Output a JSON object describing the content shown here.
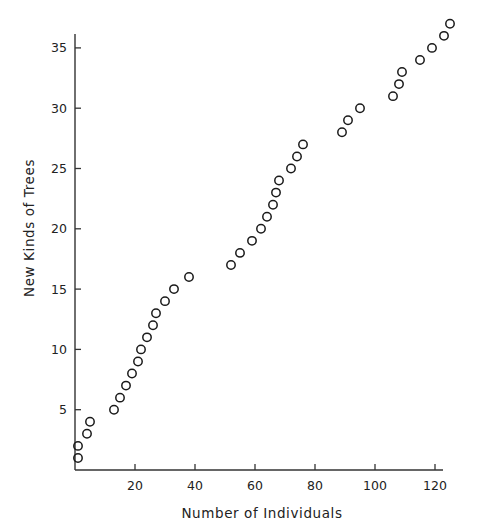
{
  "chart_data": {
    "type": "scatter",
    "title": "",
    "xlabel": "Number of Individuals",
    "ylabel": "New Kinds of Trees",
    "xlim": [
      0,
      125
    ],
    "ylim": [
      0,
      37
    ],
    "x_ticks": [
      20,
      40,
      60,
      80,
      100,
      120
    ],
    "y_ticks": [
      5,
      10,
      15,
      20,
      25,
      30,
      35
    ],
    "grid": false,
    "legend": null,
    "marker": "open-circle",
    "series": [
      {
        "name": "New kinds of trees",
        "points": [
          [
            1,
            1
          ],
          [
            1,
            2
          ],
          [
            4,
            3
          ],
          [
            5,
            4
          ],
          [
            13,
            5
          ],
          [
            15,
            6
          ],
          [
            17,
            7
          ],
          [
            19,
            8
          ],
          [
            21,
            9
          ],
          [
            22,
            10
          ],
          [
            24,
            11
          ],
          [
            26,
            12
          ],
          [
            27,
            13
          ],
          [
            30,
            14
          ],
          [
            33,
            15
          ],
          [
            38,
            16
          ],
          [
            52,
            17
          ],
          [
            55,
            18
          ],
          [
            59,
            19
          ],
          [
            62,
            20
          ],
          [
            64,
            21
          ],
          [
            66,
            22
          ],
          [
            67,
            23
          ],
          [
            68,
            24
          ],
          [
            72,
            25
          ],
          [
            74,
            26
          ],
          [
            76,
            27
          ],
          [
            89,
            28
          ],
          [
            91,
            29
          ],
          [
            95,
            30
          ],
          [
            106,
            31
          ],
          [
            108,
            32
          ],
          [
            109,
            33
          ],
          [
            115,
            34
          ],
          [
            119,
            35
          ],
          [
            123,
            36
          ],
          [
            125,
            37
          ]
        ]
      }
    ]
  }
}
